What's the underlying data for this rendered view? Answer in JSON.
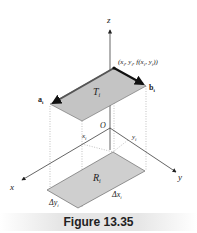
{
  "figure": {
    "caption": "Figure 13.35",
    "axes": {
      "x": "x",
      "y": "y",
      "z": "z",
      "origin": "O"
    },
    "labels": {
      "point": "(x",
      "point_full": "(xi, yi, f(xi, yi))",
      "vec_a": "a",
      "vec_b": "b",
      "tangent_patch": "T",
      "region": "R",
      "xi": "x",
      "yi": "y",
      "delta_x": "Δx",
      "delta_y": "Δy",
      "subscript": "i"
    },
    "colors": {
      "patch_fill": "#c8c8c8",
      "line": "#333333",
      "caption_bg": "#e6e6e6"
    }
  }
}
